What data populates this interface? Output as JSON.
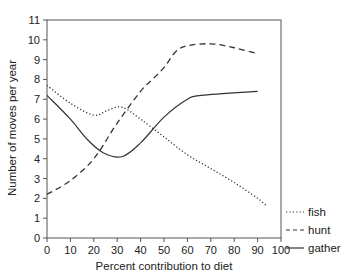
{
  "chart_data": {
    "type": "line",
    "title": "",
    "xlabel": "Percent contribution to diet",
    "ylabel": "Number of moves per year",
    "xlim": [
      0,
      100
    ],
    "ylim": [
      0,
      11
    ],
    "xticks": [
      0,
      10,
      20,
      30,
      40,
      50,
      60,
      70,
      80,
      90,
      100
    ],
    "yticks": [
      0,
      1,
      2,
      3,
      4,
      5,
      6,
      7,
      8,
      9,
      10,
      11
    ],
    "grid": false,
    "legend_position": "right",
    "series": [
      {
        "name": "fish",
        "style": "dotted",
        "x": [
          0,
          10,
          20,
          26,
          32,
          40,
          50,
          60,
          70,
          80,
          90,
          94
        ],
        "values": [
          7.7,
          6.8,
          6.2,
          6.45,
          6.6,
          6.0,
          5.1,
          4.2,
          3.5,
          2.8,
          2.0,
          1.6
        ]
      },
      {
        "name": "hunt",
        "style": "dashed",
        "x": [
          0,
          10,
          20,
          30,
          40,
          45,
          50,
          55,
          60,
          70,
          80,
          90
        ],
        "values": [
          2.2,
          2.9,
          4.0,
          5.8,
          7.4,
          8.0,
          8.6,
          9.4,
          9.7,
          9.8,
          9.6,
          9.3
        ]
      },
      {
        "name": "gather",
        "style": "solid",
        "x": [
          0,
          10,
          17,
          24,
          32,
          40,
          50,
          60,
          66,
          90
        ],
        "values": [
          7.2,
          6.0,
          5.0,
          4.3,
          4.1,
          4.8,
          6.1,
          7.0,
          7.2,
          7.4
        ]
      }
    ]
  },
  "legend": {
    "items": [
      {
        "label": "fish",
        "style": "dotted"
      },
      {
        "label": "hunt",
        "style": "dashed"
      },
      {
        "label": "gather",
        "style": "solid"
      }
    ]
  },
  "colors": {
    "line": "#333333",
    "axis": "#555555"
  }
}
